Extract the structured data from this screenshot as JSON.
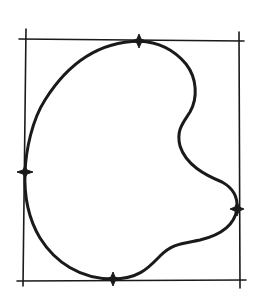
{
  "diagram": {
    "type": "bounding-box-sketch",
    "colors": {
      "stroke": "#1a1a1a",
      "background": "#ffffff"
    },
    "bounding_box": {
      "left": 24,
      "top": 40,
      "right": 239,
      "bottom": 281
    },
    "shape": "kidney-bean closed curve",
    "tangent_points": [
      {
        "name": "top",
        "x": 139,
        "y": 41
      },
      {
        "name": "left",
        "x": 25,
        "y": 172
      },
      {
        "name": "right",
        "x": 237,
        "y": 209
      },
      {
        "name": "bottom",
        "x": 113,
        "y": 279
      }
    ]
  }
}
